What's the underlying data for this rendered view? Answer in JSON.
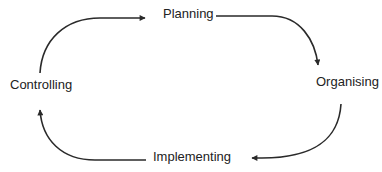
{
  "diagram": {
    "type": "cycle",
    "nodes": [
      {
        "id": "planning",
        "label": "Planning"
      },
      {
        "id": "organising",
        "label": "Organising"
      },
      {
        "id": "implementing",
        "label": "Implementing"
      },
      {
        "id": "controlling",
        "label": "Controlling"
      }
    ],
    "edges": [
      {
        "from": "planning",
        "to": "organising"
      },
      {
        "from": "organising",
        "to": "implementing"
      },
      {
        "from": "implementing",
        "to": "controlling"
      },
      {
        "from": "controlling",
        "to": "planning"
      }
    ],
    "colors": {
      "stroke": "#2a2a2a",
      "text": "#222222",
      "background": "#ffffff"
    }
  }
}
